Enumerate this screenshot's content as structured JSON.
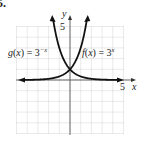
{
  "problem_number": "5.",
  "graph": {
    "x_axis_label": "x",
    "y_axis_label": "y",
    "x_tick_label": "5",
    "y_tick_label": "5",
    "grid": {
      "x_min": -5,
      "x_max": 5,
      "y_min": -5,
      "y_max": 5,
      "style": "dotted"
    },
    "curves": [
      {
        "name": "g",
        "label": "g(x) = 3^(-x)",
        "label_text": "g(x) = 3",
        "exponent": "−x",
        "color": "#111111"
      },
      {
        "name": "f",
        "label": "f(x) = 3^x",
        "label_text": "f(x) = 3",
        "exponent": "x",
        "color": "#111111"
      }
    ],
    "intersection": {
      "x": 0,
      "y": 1
    }
  },
  "chart_data": {
    "type": "line",
    "title": "",
    "xlabel": "x",
    "ylabel": "y",
    "xlim": [
      -5,
      5
    ],
    "ylim": [
      -5,
      5
    ],
    "grid": true,
    "series": [
      {
        "name": "g(x) = 3^(-x)",
        "x": [
          -1.6,
          -1.5,
          -1,
          -0.5,
          0,
          1,
          2,
          3,
          4,
          5
        ],
        "y": [
          5.8,
          5.2,
          3,
          1.73,
          1,
          0.33,
          0.11,
          0.04,
          0.01,
          0.004
        ]
      },
      {
        "name": "f(x) = 3^x",
        "x": [
          -5,
          -4,
          -3,
          -2,
          -1,
          0,
          0.5,
          1,
          1.5,
          1.6
        ],
        "y": [
          0.004,
          0.01,
          0.04,
          0.11,
          0.33,
          1,
          1.73,
          3,
          5.2,
          5.8
        ]
      }
    ],
    "annotations": [
      "g(x) = 3^(-x)",
      "f(x) = 3^x",
      "5 on x-axis",
      "5 on y-axis"
    ]
  }
}
